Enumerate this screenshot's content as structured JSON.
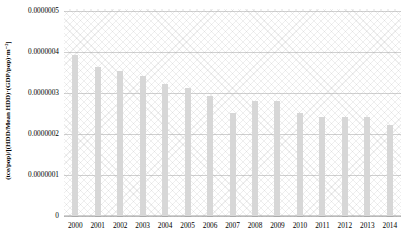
{
  "chart_data": {
    "type": "bar",
    "title": "",
    "subtitle": "",
    "xlabel": "",
    "ylabel": "(tce/pop)/[(HDD/Mean HDD)·(GDP/pop)·m⁻²]",
    "categories": [
      "2000",
      "2001",
      "2002",
      "2003",
      "2004",
      "2005",
      "2006",
      "2007",
      "2008",
      "2009",
      "2010",
      "2011",
      "2012",
      "2013",
      "2014"
    ],
    "values": [
      3.9e-07,
      3.6e-07,
      3.5e-07,
      3.4e-07,
      3.2e-07,
      3.1e-07,
      2.9e-07,
      2.5e-07,
      2.8e-07,
      2.8e-07,
      2.5e-07,
      2.4e-07,
      2.4e-07,
      2.4e-07,
      2.2e-07
    ],
    "ylim": [
      0,
      5e-07
    ],
    "ytick_values": [
      0,
      1e-07,
      2e-07,
      3e-07,
      4e-07,
      5e-07
    ],
    "ytick_labels": [
      "0",
      "0.0000001",
      "0.0000002",
      "0.0000003",
      "0.0000004",
      "0.0000005"
    ],
    "grid": true,
    "grid_axis": "y",
    "legend": false,
    "legend_position": "none",
    "bar_color": "#d7d7d7",
    "plot_background": "#ffffff",
    "plot_hatch": "crosshatch-diagonal",
    "gridline_color": "#aaaaaa"
  }
}
